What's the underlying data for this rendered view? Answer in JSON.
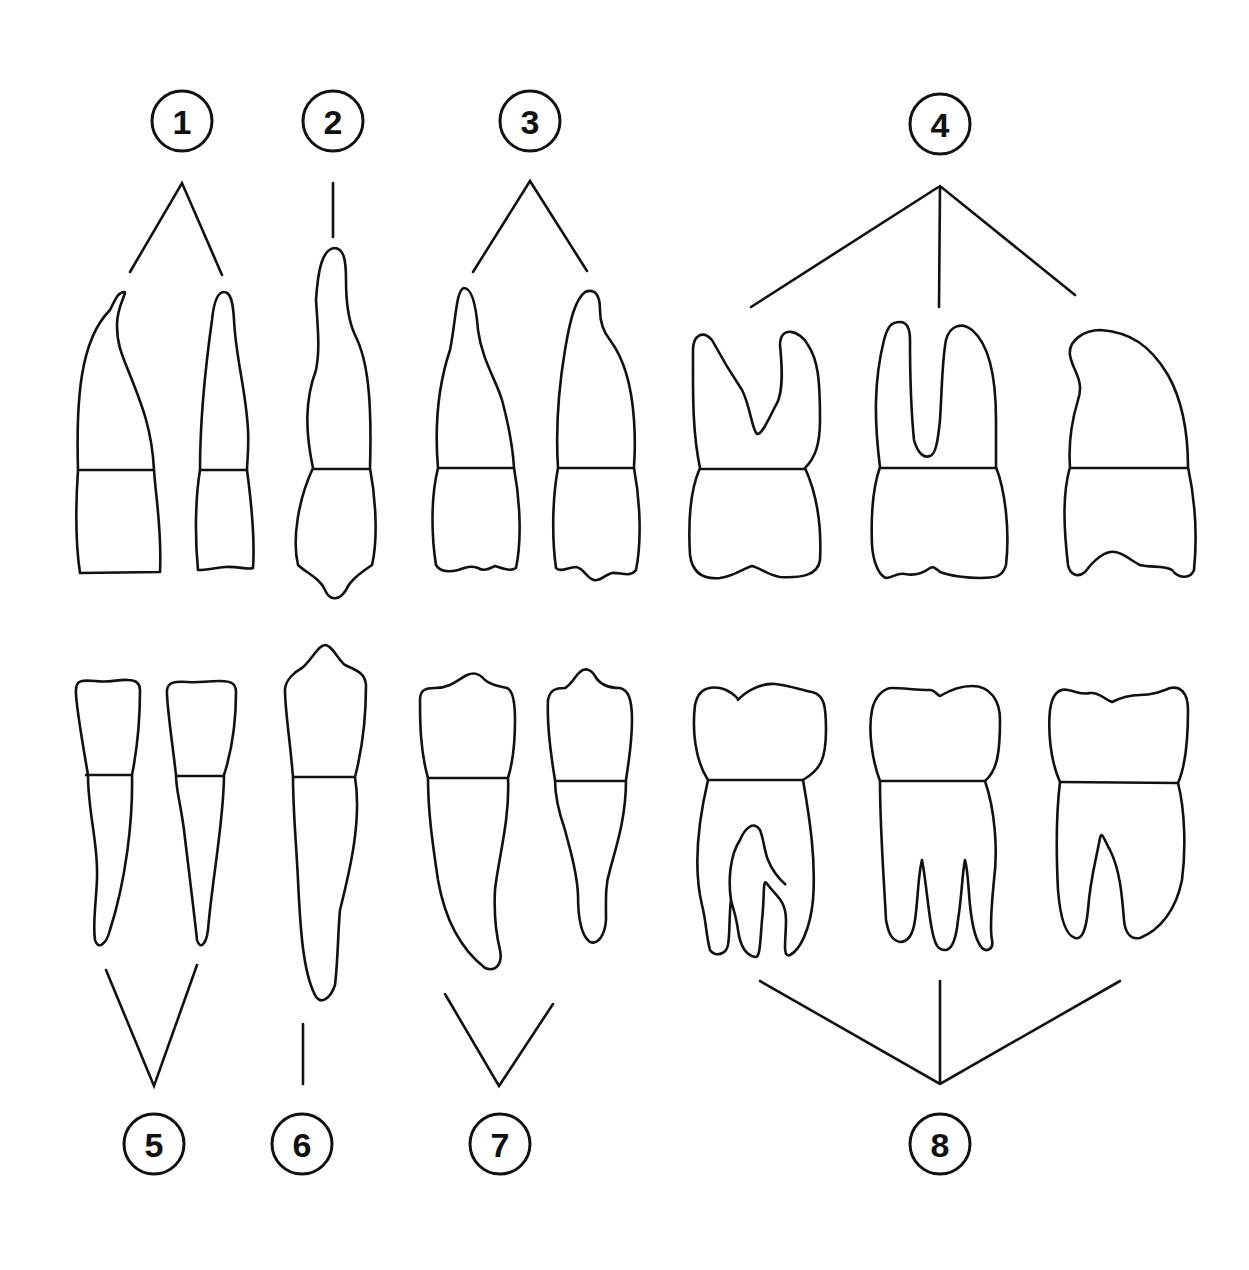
{
  "diagram": {
    "colors": {
      "line": "#111111",
      "background": "#ffffff"
    },
    "labels": [
      {
        "id": 1,
        "text": "1",
        "row": "upper",
        "teeth": 2
      },
      {
        "id": 2,
        "text": "2",
        "row": "upper",
        "teeth": 1
      },
      {
        "id": 3,
        "text": "3",
        "row": "upper",
        "teeth": 2
      },
      {
        "id": 4,
        "text": "4",
        "row": "upper",
        "teeth": 3
      },
      {
        "id": 5,
        "text": "5",
        "row": "lower",
        "teeth": 2
      },
      {
        "id": 6,
        "text": "6",
        "row": "lower",
        "teeth": 1
      },
      {
        "id": 7,
        "text": "7",
        "row": "lower",
        "teeth": 2
      },
      {
        "id": 8,
        "text": "8",
        "row": "lower",
        "teeth": 3
      }
    ]
  }
}
